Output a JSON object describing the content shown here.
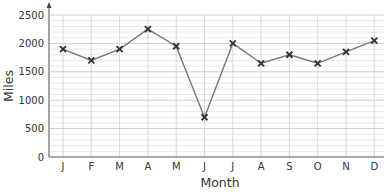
{
  "chart_data": {
    "type": "line",
    "title": "",
    "xlabel": "Month",
    "ylabel": "Miles",
    "categories": [
      "J",
      "F",
      "M",
      "A",
      "M",
      "J",
      "J",
      "A",
      "S",
      "O",
      "N",
      "D"
    ],
    "series": [
      {
        "name": "Miles",
        "values": [
          1900,
          1700,
          1900,
          2250,
          1950,
          700,
          2000,
          1650,
          1800,
          1650,
          1850,
          2050
        ]
      }
    ],
    "ylim": [
      0,
      2500
    ],
    "yticks": [
      0,
      500,
      1000,
      1500,
      2000,
      2500
    ],
    "minor_grid_step": 100,
    "grid": true,
    "marker": "x",
    "legend": null,
    "colors": {
      "line": "#7a7a7a",
      "marker": "#333333",
      "grid": "#d6d6d6",
      "axis": "#8c8c8c",
      "text": "#333333"
    }
  }
}
